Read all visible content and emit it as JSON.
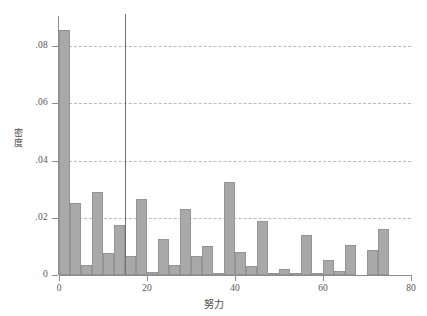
{
  "chart_data": {
    "type": "bar",
    "title": "",
    "subtitle": "",
    "xlabel": "努力",
    "ylabel": "密度",
    "xlim": [
      0,
      80
    ],
    "ylim": [
      0,
      0.0905
    ],
    "grid": true,
    "legend": null,
    "bin_width": 2.5,
    "bar_color": "#a9a9a9",
    "bar_edge_color": "#949494",
    "gridline_color": "#b9b9c4",
    "axis_color": "#8d8d8d",
    "annotations": [
      {
        "name": "vertical-reference-line",
        "type": "vline",
        "x": 15,
        "color": "#6e6e78"
      }
    ],
    "xticks": [
      0,
      20,
      40,
      60,
      80
    ],
    "xtick_labels": [
      "0",
      "20",
      "40",
      "60",
      "80"
    ],
    "yticks": [
      0,
      0.02,
      0.04,
      0.06,
      0.08
    ],
    "ytick_labels": [
      "0",
      ".02",
      ".04",
      ".06",
      ".08"
    ],
    "bins": [
      {
        "x0": 0.0,
        "x1": 2.5,
        "value": 0.0855
      },
      {
        "x0": 2.5,
        "x1": 5.0,
        "value": 0.025
      },
      {
        "x0": 5.0,
        "x1": 7.5,
        "value": 0.0036
      },
      {
        "x0": 7.5,
        "x1": 10.0,
        "value": 0.029
      },
      {
        "x0": 10.0,
        "x1": 12.5,
        "value": 0.0076
      },
      {
        "x0": 12.5,
        "x1": 15.0,
        "value": 0.0176
      },
      {
        "x0": 15.0,
        "x1": 17.5,
        "value": 0.0065
      },
      {
        "x0": 17.5,
        "x1": 20.0,
        "value": 0.0264
      },
      {
        "x0": 20.0,
        "x1": 22.5,
        "value": 0.001
      },
      {
        "x0": 22.5,
        "x1": 25.0,
        "value": 0.0125
      },
      {
        "x0": 25.0,
        "x1": 27.5,
        "value": 0.0036
      },
      {
        "x0": 27.5,
        "x1": 30.0,
        "value": 0.0231
      },
      {
        "x0": 30.0,
        "x1": 32.5,
        "value": 0.0066
      },
      {
        "x0": 32.5,
        "x1": 35.0,
        "value": 0.01
      },
      {
        "x0": 35.0,
        "x1": 37.5,
        "value": 0.0004
      },
      {
        "x0": 37.5,
        "x1": 40.0,
        "value": 0.0324
      },
      {
        "x0": 40.0,
        "x1": 42.5,
        "value": 0.0079
      },
      {
        "x0": 42.5,
        "x1": 45.0,
        "value": 0.003
      },
      {
        "x0": 45.0,
        "x1": 47.5,
        "value": 0.019
      },
      {
        "x0": 47.5,
        "x1": 50.0,
        "value": 0.0006
      },
      {
        "x0": 50.0,
        "x1": 52.5,
        "value": 0.0022
      },
      {
        "x0": 52.5,
        "x1": 55.0,
        "value": 0.0006
      },
      {
        "x0": 55.0,
        "x1": 57.5,
        "value": 0.0139
      },
      {
        "x0": 57.5,
        "x1": 60.0,
        "value": 0.0006
      },
      {
        "x0": 60.0,
        "x1": 62.5,
        "value": 0.0053
      },
      {
        "x0": 62.5,
        "x1": 65.0,
        "value": 0.0014
      },
      {
        "x0": 65.0,
        "x1": 67.5,
        "value": 0.0104
      },
      {
        "x0": 67.5,
        "x1": 70.0,
        "value": 0.0
      },
      {
        "x0": 70.0,
        "x1": 72.5,
        "value": 0.0086
      },
      {
        "x0": 72.5,
        "x1": 75.0,
        "value": 0.016
      }
    ]
  }
}
